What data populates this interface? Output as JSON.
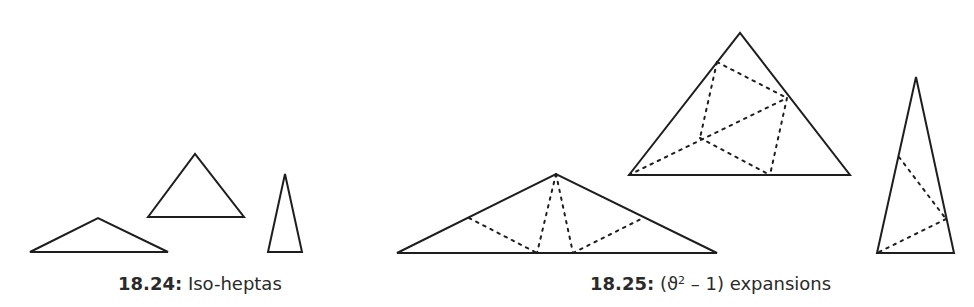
{
  "figures": [
    {
      "id": "18.24",
      "caption": {
        "number": "18.24:",
        "text": "Iso-heptas"
      },
      "triangles": [
        {
          "name": "obtuse-iso-hepta",
          "points": "30,252 98,218 168,252"
        },
        {
          "name": "medium-iso-hepta",
          "points": "148,217 195,154 244,217"
        },
        {
          "name": "thin-iso-hepta",
          "points": "268,252 285,174 302,252"
        }
      ]
    },
    {
      "id": "18.25",
      "caption": {
        "number": "18.25:",
        "open": "(ϑ",
        "exponent": "2",
        "close": " – 1) expansions"
      },
      "triangles": [
        {
          "name": "obtuse-expansion",
          "points": "397,253 556,174 717,253",
          "dotted": [
            "469,218 537,253",
            "556,174 537,253",
            "556,174 573,253",
            "573,253 643,218"
          ]
        },
        {
          "name": "medium-expansion",
          "points": "629,175 740,33 850,175",
          "dotted": [
            "717,62 787,98",
            "717,62 700,138",
            "787,98 770,175",
            "629,175 787,98",
            "700,138 770,175"
          ]
        },
        {
          "name": "thin-expansion",
          "points": "877,253 916,77 954,253",
          "dotted": [
            "899,157 946,219",
            "946,219 877,253"
          ]
        }
      ]
    }
  ],
  "colors": {
    "stroke": "#1e1e1e",
    "text": "#2a2a2a",
    "background": "#ffffff"
  }
}
